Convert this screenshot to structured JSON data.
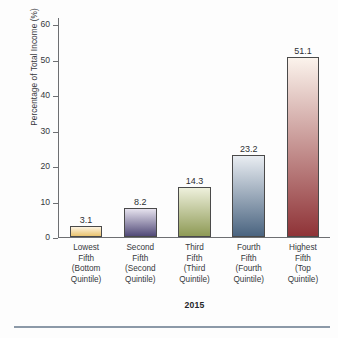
{
  "chart_data": {
    "type": "bar",
    "title": "",
    "xlabel": "2015",
    "ylabel": "Percentage of Total Income (%)",
    "ylim": [
      0,
      62
    ],
    "yticks": [
      0,
      10,
      20,
      30,
      40,
      50,
      60
    ],
    "grid": false,
    "legend": "none",
    "categories": [
      "Lowest Fifth (Bottom Quintile)",
      "Second Fifth (Second Quintile)",
      "Third Fifth (Third Quintile)",
      "Fourth Fifth (Fourth Quintile)",
      "Highest Fifth (Top Quintile)"
    ],
    "category_lines": [
      [
        "Lowest",
        "Fifth",
        "(Bottom",
        "Quintile)"
      ],
      [
        "Second",
        "Fifth",
        "(Second",
        "Quintile)"
      ],
      [
        "Third",
        "Fifth",
        "(Third",
        "Quintile)"
      ],
      [
        "Fourth",
        "Fifth",
        "(Fourth",
        "Quintile)"
      ],
      [
        "Highest",
        "Fifth",
        "(Top",
        "Quintile)"
      ]
    ],
    "values": [
      3.1,
      8.2,
      14.3,
      23.2,
      51.1
    ],
    "value_labels": [
      "3.1",
      "8.2",
      "14.3",
      "23.2",
      "51.1"
    ],
    "bar_colors_top": [
      "#fdf3e0",
      "#e6e2ee",
      "#eef0dc",
      "#e9edf2",
      "#fbf3ec"
    ],
    "bar_colors_bottom": [
      "#e9c36f",
      "#514a78",
      "#8e9a55",
      "#4a6480",
      "#8f3337"
    ],
    "bar_outline": "#4a4a4a"
  },
  "axis": {
    "tick_labels": [
      "0",
      "10",
      "20",
      "30",
      "40",
      "50",
      "60"
    ]
  },
  "figure": {
    "x_axis_title": "2015",
    "y_axis_title": "Percentage of Total Income (%)"
  }
}
